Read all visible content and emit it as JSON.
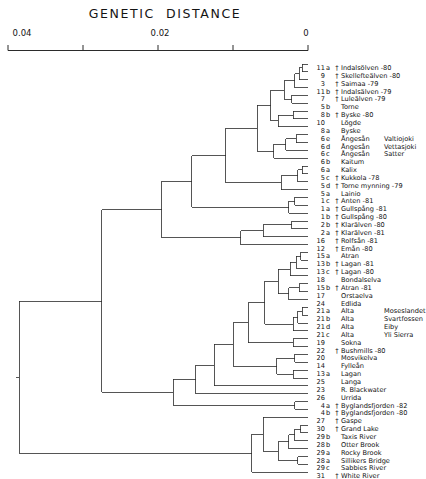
{
  "chart_title": "GENETIC  DISTANCE",
  "axis": {
    "label": "GENETIC  DISTANCE",
    "ticks": [
      {
        "value": 0.04,
        "label": "0.04",
        "x": 8
      },
      {
        "value": 0.03,
        "label": "",
        "x": 83
      },
      {
        "value": 0.02,
        "label": "0.02",
        "x": 158
      },
      {
        "value": 0.01,
        "label": "",
        "x": 233
      },
      {
        "value": 0,
        "label": "0",
        "x": 308
      }
    ],
    "min": 0,
    "max": 0.04,
    "direction": "reversed",
    "pixel_left": 8,
    "pixel_right": 308
  },
  "dagger_symbol": "†",
  "line_color": "#2b2b2b",
  "leaves": [
    {
      "num": "11",
      "sub": "a",
      "dagger": true,
      "name": "Indalsölven -80",
      "name2": ""
    },
    {
      "num": "9",
      "sub": "",
      "dagger": true,
      "name": "Skellefteälven -80",
      "name2": ""
    },
    {
      "num": "3",
      "sub": "",
      "dagger": true,
      "name": "Saimaa -79",
      "name2": ""
    },
    {
      "num": "11",
      "sub": "b",
      "dagger": true,
      "name": "Indalsälven -79",
      "name2": ""
    },
    {
      "num": "7",
      "sub": "",
      "dagger": true,
      "name": "Luleälven -79",
      "name2": ""
    },
    {
      "num": "5",
      "sub": "b",
      "dagger": false,
      "name": "Torne",
      "name2": ""
    },
    {
      "num": "8",
      "sub": "b",
      "dagger": true,
      "name": "Byske -80",
      "name2": ""
    },
    {
      "num": "10",
      "sub": "",
      "dagger": false,
      "name": "Lögde",
      "name2": ""
    },
    {
      "num": "8",
      "sub": "a",
      "dagger": false,
      "name": "Byske",
      "name2": ""
    },
    {
      "num": "6",
      "sub": "e",
      "dagger": false,
      "name": "Ångesån",
      "name2": "Valtiojoki"
    },
    {
      "num": "6",
      "sub": "d",
      "dagger": false,
      "name": "Ångesån",
      "name2": "Vettasjoki"
    },
    {
      "num": "6",
      "sub": "c",
      "dagger": false,
      "name": "Ångesån",
      "name2": "Satter"
    },
    {
      "num": "6",
      "sub": "b",
      "dagger": false,
      "name": "Kaitum",
      "name2": ""
    },
    {
      "num": "6",
      "sub": "a",
      "dagger": false,
      "name": "Kalix",
      "name2": ""
    },
    {
      "num": "5",
      "sub": "c",
      "dagger": true,
      "name": "Kukkola -78",
      "name2": ""
    },
    {
      "num": "5",
      "sub": "d",
      "dagger": true,
      "name": "Torne mynning -79",
      "name2": ""
    },
    {
      "num": "5",
      "sub": "a",
      "dagger": false,
      "name": "Lainio",
      "name2": ""
    },
    {
      "num": "1",
      "sub": "c",
      "dagger": true,
      "name": "Anten -81",
      "name2": ""
    },
    {
      "num": "1",
      "sub": "a",
      "dagger": true,
      "name": "Gullspång -81",
      "name2": ""
    },
    {
      "num": "1",
      "sub": "b",
      "dagger": true,
      "name": "Gullspång -80",
      "name2": ""
    },
    {
      "num": "2",
      "sub": "b",
      "dagger": true,
      "name": "Klarälven -80",
      "name2": ""
    },
    {
      "num": "2",
      "sub": "a",
      "dagger": true,
      "name": "Klarälven -81",
      "name2": ""
    },
    {
      "num": "16",
      "sub": "",
      "dagger": true,
      "name": "Rolfsån -81",
      "name2": ""
    },
    {
      "num": "12",
      "sub": "",
      "dagger": true,
      "name": "Emån -80",
      "name2": ""
    },
    {
      "num": "15",
      "sub": "a",
      "dagger": false,
      "name": "Atran",
      "name2": ""
    },
    {
      "num": "13",
      "sub": "b",
      "dagger": true,
      "name": "Lagan -81",
      "name2": ""
    },
    {
      "num": "13",
      "sub": "c",
      "dagger": true,
      "name": "Lagan -80",
      "name2": ""
    },
    {
      "num": "18",
      "sub": "",
      "dagger": false,
      "name": "Bondalselva",
      "name2": ""
    },
    {
      "num": "15",
      "sub": "b",
      "dagger": true,
      "name": "Atran -81",
      "name2": ""
    },
    {
      "num": "17",
      "sub": "",
      "dagger": false,
      "name": "Orstaelva",
      "name2": ""
    },
    {
      "num": "24",
      "sub": "",
      "dagger": false,
      "name": "Edlida",
      "name2": ""
    },
    {
      "num": "21",
      "sub": "a",
      "dagger": false,
      "name": "Alta",
      "name2": "Moseslandet"
    },
    {
      "num": "21",
      "sub": "b",
      "dagger": false,
      "name": "Alta",
      "name2": "Svartfossen"
    },
    {
      "num": "21",
      "sub": "d",
      "dagger": false,
      "name": "Alta",
      "name2": "Eiby"
    },
    {
      "num": "21",
      "sub": "c",
      "dagger": false,
      "name": "Alta",
      "name2": "Yli Sierra"
    },
    {
      "num": "19",
      "sub": "",
      "dagger": false,
      "name": "Sokna",
      "name2": ""
    },
    {
      "num": "22",
      "sub": "",
      "dagger": true,
      "name": "Bushmills -80",
      "name2": ""
    },
    {
      "num": "20",
      "sub": "",
      "dagger": false,
      "name": "Mosvikelva",
      "name2": ""
    },
    {
      "num": "14",
      "sub": "",
      "dagger": false,
      "name": "Fylleån",
      "name2": ""
    },
    {
      "num": "13",
      "sub": "a",
      "dagger": false,
      "name": "Lagan",
      "name2": ""
    },
    {
      "num": "25",
      "sub": "",
      "dagger": false,
      "name": "Langa",
      "name2": ""
    },
    {
      "num": "23",
      "sub": "",
      "dagger": false,
      "name": "R. Blackwater",
      "name2": ""
    },
    {
      "num": "26",
      "sub": "",
      "dagger": false,
      "name": "Urrida",
      "name2": ""
    },
    {
      "num": "4",
      "sub": "a",
      "dagger": true,
      "name": "Byglandsfjorden -82",
      "name2": ""
    },
    {
      "num": "4",
      "sub": "b",
      "dagger": true,
      "name": "Byglandsfjorden -80",
      "name2": ""
    },
    {
      "num": "27",
      "sub": "",
      "dagger": true,
      "name": "Gaspe",
      "name2": ""
    },
    {
      "num": "30",
      "sub": "",
      "dagger": true,
      "name": "Grand Lake",
      "name2": ""
    },
    {
      "num": "29",
      "sub": "b",
      "dagger": false,
      "name": "Taxis River",
      "name2": ""
    },
    {
      "num": "28",
      "sub": "b",
      "dagger": false,
      "name": "Otter Brook",
      "name2": ""
    },
    {
      "num": "29",
      "sub": "a",
      "dagger": false,
      "name": "Rocky Brook",
      "name2": ""
    },
    {
      "num": "28",
      "sub": "a",
      "dagger": false,
      "name": "Sillikers Bridge",
      "name2": ""
    },
    {
      "num": "29",
      "sub": "c",
      "dagger": false,
      "name": "Sabbies River",
      "name2": ""
    },
    {
      "num": "31",
      "sub": "",
      "dagger": true,
      "name": "White River",
      "name2": ""
    }
  ],
  "chart_data": {
    "type": "dendrogram",
    "title": "GENETIC  DISTANCE",
    "xlabel": "GENETIC DISTANCE",
    "ylabel": "",
    "xlim": [
      0.04,
      0
    ],
    "grid": false,
    "legend": "none",
    "orientation": "horizontal-right-to-left",
    "n_leaves": 53,
    "distance_ticks": [
      0.04,
      0.03,
      0.02,
      0.01,
      0
    ],
    "categories": [
      "11a Indalsölven -80",
      "9 Skellefteälven -80",
      "3 Saimaa -79",
      "11b Indalsälven -79",
      "7 Luleälven -79",
      "5b Torne",
      "8b Byske -80",
      "10 Lögde",
      "8a Byske",
      "6e Ångesån Valtiojoki",
      "6d Ångesån Vettasjoki",
      "6c Ångesån Satter",
      "6b Kaitum",
      "6a Kalix",
      "5c Kukkola -78",
      "5d Torne mynning -79",
      "5a Lainio",
      "1c Anten -81",
      "1a Gullspång -81",
      "1b Gullspång -80",
      "2b Klarälven -80",
      "2a Klarälven -81",
      "16 Rolfsån -81",
      "12 Emån -80",
      "15a Atran",
      "13b Lagan -81",
      "13c Lagan -80",
      "18 Bondalselva",
      "15b Atran -81",
      "17 Orstaelva",
      "24 Edlida",
      "21a Alta Moseslandet",
      "21b Alta Svartfossen",
      "21d Alta Eiby",
      "21c Alta Yli Sierra",
      "19 Sokna",
      "22 Bushmills -80",
      "20 Mosvikelva",
      "14 Fylleån",
      "13a Lagan",
      "25 Langa",
      "23 R. Blackwater",
      "26 Urrida",
      "4a Byglandsfjorden -82",
      "4b Byglandsfjorden -80",
      "27 Gaspe",
      "30 Grand Lake",
      "29b Taxis River",
      "28b Otter Brook",
      "29a Rocky Brook",
      "28a Sillikers Bridge",
      "29c Sabbies River",
      "31 White River"
    ],
    "merges": [
      {
        "id": "m1",
        "children": [
          "leaf0",
          "leaf1"
        ],
        "distance": 0.0008
      },
      {
        "id": "m2",
        "children": [
          "m1",
          "leaf2"
        ],
        "distance": 0.0012
      },
      {
        "id": "m3",
        "children": [
          "m2",
          "leaf3"
        ],
        "distance": 0.0018
      },
      {
        "id": "m4",
        "children": [
          "leaf4",
          "leaf5"
        ],
        "distance": 0.0022
      },
      {
        "id": "m5",
        "children": [
          "m3",
          "m4"
        ],
        "distance": 0.0032
      },
      {
        "id": "m6",
        "children": [
          "leaf6",
          "leaf7"
        ],
        "distance": 0.002
      },
      {
        "id": "m7",
        "children": [
          "m6",
          "leaf8"
        ],
        "distance": 0.004
      },
      {
        "id": "m8",
        "children": [
          "m5",
          "m7"
        ],
        "distance": 0.005
      },
      {
        "id": "m9",
        "children": [
          "leaf9",
          "leaf10"
        ],
        "distance": 0.0016
      },
      {
        "id": "m10",
        "children": [
          "m9",
          "leaf11"
        ],
        "distance": 0.003
      },
      {
        "id": "m11",
        "children": [
          "m10",
          "leaf12"
        ],
        "distance": 0.0046
      },
      {
        "id": "m12",
        "children": [
          "m8",
          "m11"
        ],
        "distance": 0.0068
      },
      {
        "id": "m13",
        "children": [
          "leaf13",
          "leaf14"
        ],
        "distance": 0.0008
      },
      {
        "id": "m14",
        "children": [
          "m13",
          "leaf15"
        ],
        "distance": 0.0014
      },
      {
        "id": "m15",
        "children": [
          "m14",
          "leaf16"
        ],
        "distance": 0.0036
      },
      {
        "id": "m16",
        "children": [
          "m12",
          "m15"
        ],
        "distance": 0.011
      },
      {
        "id": "m17",
        "children": [
          "leaf17",
          "leaf18"
        ],
        "distance": 0.0018
      },
      {
        "id": "m18",
        "children": [
          "m17",
          "leaf19"
        ],
        "distance": 0.0026
      },
      {
        "id": "m19",
        "children": [
          "m16",
          "m18"
        ],
        "distance": 0.0155
      },
      {
        "id": "m20",
        "children": [
          "leaf20",
          "leaf21"
        ],
        "distance": 0.0022
      },
      {
        "id": "m21",
        "children": [
          "m20",
          "leaf22"
        ],
        "distance": 0.006
      },
      {
        "id": "m22",
        "children": [
          "m21",
          "leaf23"
        ],
        "distance": 0.009
      },
      {
        "id": "m23",
        "children": [
          "m19",
          "m22"
        ],
        "distance": 0.0195
      },
      {
        "id": "m24",
        "children": [
          "leaf24",
          "leaf25"
        ],
        "distance": 0.001
      },
      {
        "id": "m25",
        "children": [
          "m24",
          "leaf26"
        ],
        "distance": 0.0016
      },
      {
        "id": "m26",
        "children": [
          "m25",
          "leaf27"
        ],
        "distance": 0.0024
      },
      {
        "id": "m27",
        "children": [
          "leaf28",
          "leaf29"
        ],
        "distance": 0.0012
      },
      {
        "id": "m28",
        "children": [
          "m27",
          "leaf30"
        ],
        "distance": 0.0026
      },
      {
        "id": "m29",
        "children": [
          "m26",
          "m28"
        ],
        "distance": 0.004
      },
      {
        "id": "m30",
        "children": [
          "leaf31",
          "leaf32"
        ],
        "distance": 0.0008
      },
      {
        "id": "m31",
        "children": [
          "m30",
          "leaf33"
        ],
        "distance": 0.0014
      },
      {
        "id": "m32",
        "children": [
          "m31",
          "leaf34"
        ],
        "distance": 0.002
      },
      {
        "id": "m33",
        "children": [
          "m29",
          "m32"
        ],
        "distance": 0.0058
      },
      {
        "id": "m34",
        "children": [
          "leaf35",
          "leaf36"
        ],
        "distance": 0.002
      },
      {
        "id": "m35",
        "children": [
          "m33",
          "m34"
        ],
        "distance": 0.008
      },
      {
        "id": "m36",
        "children": [
          "leaf37",
          "leaf38"
        ],
        "distance": 0.0018
      },
      {
        "id": "m37",
        "children": [
          "leaf39",
          "leaf40"
        ],
        "distance": 0.002
      },
      {
        "id": "m38",
        "children": [
          "m36",
          "m37"
        ],
        "distance": 0.0042
      },
      {
        "id": "m39",
        "children": [
          "m35",
          "m38"
        ],
        "distance": 0.01
      },
      {
        "id": "m40",
        "children": [
          "m39",
          "leaf41"
        ],
        "distance": 0.0125
      },
      {
        "id": "m41",
        "children": [
          "m40",
          "leaf42"
        ],
        "distance": 0.015
      },
      {
        "id": "m42",
        "children": [
          "leaf43",
          "leaf44"
        ],
        "distance": 0.0018
      },
      {
        "id": "m43",
        "children": [
          "m41",
          "m42"
        ],
        "distance": 0.018
      },
      {
        "id": "m44",
        "children": [
          "m23",
          "m43"
        ],
        "distance": 0.0275
      },
      {
        "id": "m45",
        "children": [
          "leaf46",
          "leaf47"
        ],
        "distance": 0.001
      },
      {
        "id": "m46",
        "children": [
          "m45",
          "leaf48"
        ],
        "distance": 0.0018
      },
      {
        "id": "m47",
        "children": [
          "m46",
          "leaf49"
        ],
        "distance": 0.0026
      },
      {
        "id": "m48",
        "children": [
          "leaf50",
          "leaf51"
        ],
        "distance": 0.0014
      },
      {
        "id": "m49",
        "children": [
          "m47",
          "m48"
        ],
        "distance": 0.004
      },
      {
        "id": "m50",
        "children": [
          "leaf45",
          "m49"
        ],
        "distance": 0.006
      },
      {
        "id": "m51",
        "children": [
          "m50",
          "leaf52"
        ],
        "distance": 0.0075
      },
      {
        "id": "root",
        "children": [
          "m44",
          "m51"
        ],
        "distance": 0.0385
      }
    ]
  }
}
